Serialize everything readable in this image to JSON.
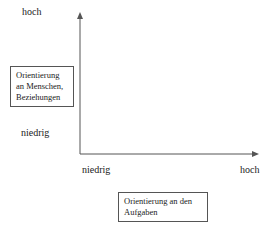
{
  "diagram": {
    "y_axis": {
      "high_label": "hoch",
      "low_label": "niedrig",
      "title": "Orientierung an Menschen, Beziehungen",
      "title_lines": [
        "Orientierung",
        "an Menschen,",
        "Beziehungen"
      ]
    },
    "x_axis": {
      "low_label": "niedrig",
      "high_label": "hoch",
      "title": "Orientierung an den Aufgaben",
      "title_lines": [
        "Orientierung an den",
        "Aufgaben"
      ]
    },
    "colors": {
      "axis": "#555555",
      "text": "#222222",
      "background": "#ffffff"
    }
  }
}
